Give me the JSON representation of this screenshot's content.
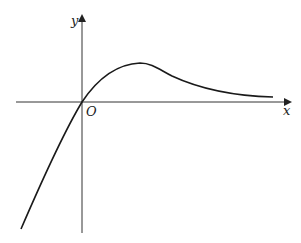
{
  "figure": {
    "type": "function-graph",
    "axes": {
      "x_label": "x",
      "y_label": "y",
      "origin_label": "O"
    },
    "curve": {
      "description": "Curve passes through origin, rises to a single maximum in the first quadrant, then decays asymptotically toward the positive x-axis; for x<0 it decreases steeply into the third quadrant.",
      "color": "#1a1a1a"
    },
    "colors": {
      "axis": "#333333",
      "background": "#ffffff"
    }
  }
}
